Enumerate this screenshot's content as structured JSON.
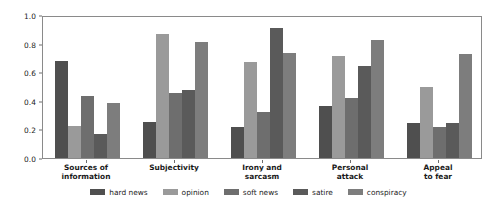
{
  "chart_data": {
    "type": "bar",
    "title": "",
    "subtitle": "",
    "xlabel": "",
    "ylabel": "",
    "ylim": [
      0.0,
      1.0
    ],
    "grid": false,
    "legend_position": "bottom",
    "ytick_labels": [
      "0.0",
      "0.2",
      "0.4",
      "0.6",
      "0.8",
      "1.0"
    ],
    "ytick_values": [
      0.0,
      0.2,
      0.4,
      0.6,
      0.8,
      1.0
    ],
    "categories": [
      "Sources of\ninformation",
      "Subjectivity",
      "Irony and\nsarcasm",
      "Personal\nattack",
      "Appeal\nto fear"
    ],
    "category_lines": [
      [
        "Sources of",
        "information"
      ],
      [
        "Subjectivity"
      ],
      [
        "Irony and",
        "sarcasm"
      ],
      [
        "Personal",
        "attack"
      ],
      [
        "Appeal",
        "to fear"
      ]
    ],
    "series": [
      {
        "name": "hard news",
        "color": "#4f4f4f",
        "values": [
          0.68,
          0.255,
          0.22,
          0.365,
          0.245
        ]
      },
      {
        "name": "opinion",
        "color": "#9a9a9a",
        "values": [
          0.225,
          0.87,
          0.67,
          0.715,
          0.495
        ]
      },
      {
        "name": "soft news",
        "color": "#6e6e6e",
        "values": [
          0.435,
          0.455,
          0.32,
          0.42,
          0.215
        ]
      },
      {
        "name": "satire",
        "color": "#5a5a5a",
        "values": [
          0.165,
          0.475,
          0.91,
          0.645,
          0.245
        ]
      },
      {
        "name": "conspiracy",
        "color": "#7d7d7d",
        "values": [
          0.385,
          0.81,
          0.735,
          0.825,
          0.725
        ]
      }
    ]
  },
  "legend": {
    "items": [
      {
        "label": "hard news",
        "color": "#4f4f4f"
      },
      {
        "label": "opinion",
        "color": "#9a9a9a"
      },
      {
        "label": "soft news",
        "color": "#6e6e6e"
      },
      {
        "label": "satire",
        "color": "#5a5a5a"
      },
      {
        "label": "conspiracy",
        "color": "#7d7d7d"
      }
    ]
  },
  "axis": {
    "frame_color": "#8a8a8a",
    "tick_color": "#6e6e6e",
    "text_color": "#1a1a1a"
  }
}
